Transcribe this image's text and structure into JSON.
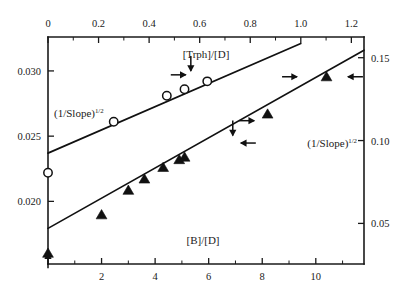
{
  "chart_data": {
    "type": "scatter",
    "title": "",
    "subtitle": "",
    "axes": {
      "top": {
        "label": "[Trph]/[D]",
        "ticks": [
          0,
          0.2,
          0.4,
          0.6,
          0.8,
          1.0,
          1.2
        ],
        "tick_labels": [
          "0",
          "0.2",
          "0.4",
          "0.6",
          "0.8",
          "1.0",
          "1.2"
        ],
        "minor_ticks": [
          0.1,
          0.3,
          0.5,
          0.7,
          0.9,
          1.1
        ],
        "range": [
          0,
          1.25
        ]
      },
      "bottom": {
        "label": "[B]/[D]",
        "ticks": [
          2,
          4,
          6,
          8,
          10
        ],
        "tick_labels": [
          "2",
          "4",
          "6",
          "8",
          "10"
        ],
        "minor_ticks": [
          1,
          3,
          5,
          7,
          9,
          11
        ],
        "range": [
          0,
          11.8
        ]
      },
      "left": {
        "label": "(1/Slope)1/2",
        "label_base": "(1/Slope)",
        "label_exponent": "1/2",
        "ticks": [
          0.02,
          0.025,
          0.03
        ],
        "tick_labels": [
          "0.020",
          "0.025",
          "0.030"
        ],
        "range": [
          0.0152,
          0.0326
        ]
      },
      "right": {
        "label": "(1/Slope)1/2",
        "label_base": "(1/Slope)",
        "label_exponent": "1/2",
        "ticks": [
          0.05,
          0.1,
          0.15
        ],
        "tick_labels": [
          "0.05",
          "0.10",
          "0.15"
        ],
        "range": [
          0.0255,
          0.1625
        ]
      },
      "grid": false,
      "legend": "none"
    },
    "series": [
      {
        "name": "open-circles",
        "marker": "open-circle",
        "x_axis": "top",
        "y_axis": "left",
        "points": [
          {
            "x": 0.0,
            "y": 0.0222
          },
          {
            "x": 0.26,
            "y": 0.0261
          },
          {
            "x": 0.47,
            "y": 0.0281
          },
          {
            "x": 0.54,
            "y": 0.0286
          },
          {
            "x": 0.63,
            "y": 0.0292
          }
        ],
        "fit_line": {
          "x_start": 0.0,
          "x_end": 1.0,
          "y_start": 0.0237,
          "y_end": 0.0321
        }
      },
      {
        "name": "filled-triangles",
        "marker": "filled-triangle",
        "x_axis": "bottom",
        "y_axis": "right",
        "points": [
          {
            "x": 0.0,
            "y": 0.032
          },
          {
            "x": 2.0,
            "y": 0.0552
          },
          {
            "x": 3.0,
            "y": 0.07
          },
          {
            "x": 3.6,
            "y": 0.0768
          },
          {
            "x": 4.3,
            "y": 0.0838
          },
          {
            "x": 4.9,
            "y": 0.0885
          },
          {
            "x": 5.1,
            "y": 0.09
          },
          {
            "x": 8.2,
            "y": 0.116
          },
          {
            "x": 10.4,
            "y": 0.1385
          }
        ],
        "fit_line": {
          "x_start": 0.0,
          "x_end": 11.8,
          "y_start": 0.047,
          "y_end": 0.1545
        }
      }
    ],
    "annotations": [
      {
        "type": "arrow",
        "direction": "right",
        "x": 0.545,
        "y": 0.0297,
        "axis": "top-left"
      },
      {
        "type": "arrow",
        "direction": "down",
        "x": 0.565,
        "y": 0.03,
        "axis": "top-left"
      },
      {
        "type": "arrow",
        "direction": "down",
        "x": 6.9,
        "y": 0.103,
        "axis": "bottom-right"
      },
      {
        "type": "arrow",
        "direction": "left",
        "x": 7.2,
        "y": 0.0985,
        "axis": "bottom-right"
      },
      {
        "type": "arrow",
        "direction": "right",
        "x": 7.7,
        "y": 0.112,
        "axis": "bottom-right"
      },
      {
        "type": "arrow",
        "direction": "right",
        "x": 9.3,
        "y": 0.1385,
        "axis": "bottom-right"
      },
      {
        "type": "arrow",
        "direction": "left",
        "x": 11.2,
        "y": 0.1385,
        "axis": "bottom-right"
      },
      {
        "type": "arrow",
        "direction": "up",
        "x": 0.0,
        "y": 0.032,
        "axis": "bottom-right"
      }
    ]
  },
  "colors": {
    "ink": "#1a1a1a",
    "line": "#111111",
    "background": "#ffffff"
  }
}
